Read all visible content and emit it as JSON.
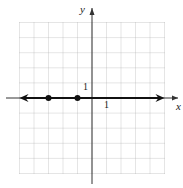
{
  "chart_data": {
    "type": "line",
    "title": "",
    "xlabel": "x",
    "ylabel": "y",
    "xlim": [
      -5,
      5
    ],
    "ylim": [
      -5,
      5
    ],
    "grid": true,
    "tick_labels": {
      "x": "1",
      "y": "1"
    },
    "series": [
      {
        "name": "line y=0",
        "description": "horizontal line along x-axis with arrows both ends",
        "x": [
          -5,
          5
        ],
        "values": [
          0,
          0
        ]
      }
    ],
    "points": [
      {
        "x": -3,
        "y": 0
      },
      {
        "x": -1,
        "y": 0
      }
    ]
  },
  "labels": {
    "x_axis": "x",
    "y_axis": "y",
    "x_tick": "1",
    "y_tick": "1"
  }
}
